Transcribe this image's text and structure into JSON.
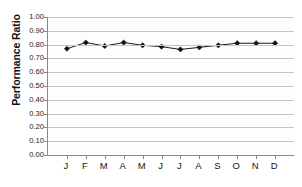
{
  "chart_data": {
    "type": "line",
    "title": "",
    "subtitle": "",
    "xlabel": "",
    "ylabel": "Performance Ratio",
    "categories": [
      "J",
      "F",
      "M",
      "A",
      "M",
      "J",
      "J",
      "A",
      "S",
      "O",
      "N",
      "D"
    ],
    "values": [
      0.77,
      0.815,
      0.79,
      0.815,
      0.795,
      0.785,
      0.765,
      0.78,
      0.795,
      0.81,
      0.81,
      0.81
    ],
    "series": [
      {
        "name": "Performance Ratio",
        "values": [
          0.77,
          0.815,
          0.79,
          0.815,
          0.795,
          0.785,
          0.765,
          0.78,
          0.795,
          0.81,
          0.81,
          0.81
        ]
      }
    ],
    "ylim": [
      0.0,
      1.0
    ],
    "ytick_labels": [
      "1.00",
      "0.90",
      "0.80",
      "0.70",
      "0.60",
      "0.50",
      "0.40",
      "0.30",
      "0.20",
      "0.10",
      "0.00"
    ],
    "ytick_values": [
      1.0,
      0.9,
      0.8,
      0.7,
      0.6,
      0.5,
      0.4,
      0.3,
      0.2,
      0.1,
      0.0
    ],
    "grid": true,
    "grid_axis": "y",
    "legend": false,
    "legend_position": "none",
    "marker": "diamond",
    "line_color": "#1a1a1a",
    "marker_color": "#111111",
    "grid_color": "#c4c4c4",
    "axis_color": "#8a8a8a",
    "plot_background": "#fdfdfd"
  }
}
